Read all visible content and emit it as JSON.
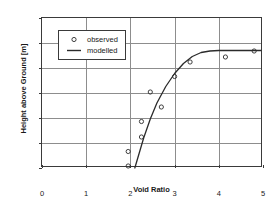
{
  "chart_data": {
    "type": "scatter",
    "title": "",
    "xlabel": "Void Ratio",
    "ylabel": "Height above Ground [m]",
    "xlim": [
      0,
      5
    ],
    "ylim": [
      0,
      30
    ],
    "xticks": [
      "0",
      "1",
      "2",
      "3",
      "4",
      "5"
    ],
    "yticks": [
      "0",
      "5",
      "10",
      "15",
      "20",
      "25",
      "30"
    ],
    "grid": true,
    "legend_position": "upper-left",
    "series": [
      {
        "name": "observed",
        "marker": "open-circle",
        "x": [
          1.95,
          1.95,
          2.25,
          2.25,
          2.45,
          2.7,
          3.0,
          3.35,
          4.15,
          4.8
        ],
        "y": [
          0.4,
          3.3,
          6.2,
          9.3,
          15.2,
          12.2,
          18.3,
          21.2,
          22.2,
          23.4
        ]
      },
      {
        "name": "modelled",
        "marker": "line",
        "x": [
          2.1,
          2.2,
          2.3,
          2.45,
          2.6,
          2.8,
          3.0,
          3.2,
          3.4,
          3.6,
          3.8,
          4.0,
          4.3,
          4.6,
          4.95
        ],
        "y": [
          0.0,
          3.0,
          6.0,
          9.8,
          13.0,
          16.3,
          18.9,
          20.9,
          22.3,
          23.1,
          23.4,
          23.5,
          23.5,
          23.5,
          23.5
        ]
      }
    ]
  },
  "legend": {
    "items": [
      {
        "label": "observed",
        "symbol": "open-circle"
      },
      {
        "label": "modelled",
        "symbol": "line"
      }
    ]
  }
}
